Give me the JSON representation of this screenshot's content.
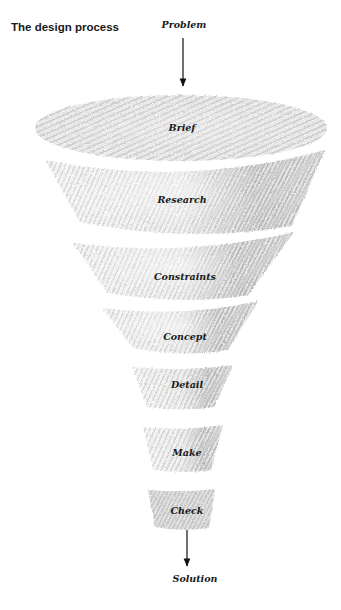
{
  "title": "The design process",
  "input_label": "Problem",
  "output_label": "Solution",
  "stages": [
    {
      "label": "Brief"
    },
    {
      "label": "Research"
    },
    {
      "label": "Constraints"
    },
    {
      "label": "Concept"
    },
    {
      "label": "Detail"
    },
    {
      "label": "Make"
    },
    {
      "label": "Check"
    }
  ],
  "colors": {
    "text": "#1a1a1a",
    "pencil_light": "#c9c9c9",
    "pencil_dark": "#9a9a9a",
    "arrow": "#111111"
  }
}
